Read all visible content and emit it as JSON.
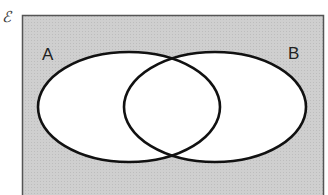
{
  "diagram": {
    "type": "venn",
    "universal_set": {
      "symbol": "ℰ",
      "fill": "#cccccc",
      "border": "#444444"
    },
    "sets": [
      {
        "label": "A",
        "fill": "#ffffff",
        "stroke": "#111111"
      },
      {
        "label": "B",
        "fill": "#ffffff",
        "stroke": "#111111"
      }
    ],
    "shaded_region": "complement of A ∪ B"
  }
}
